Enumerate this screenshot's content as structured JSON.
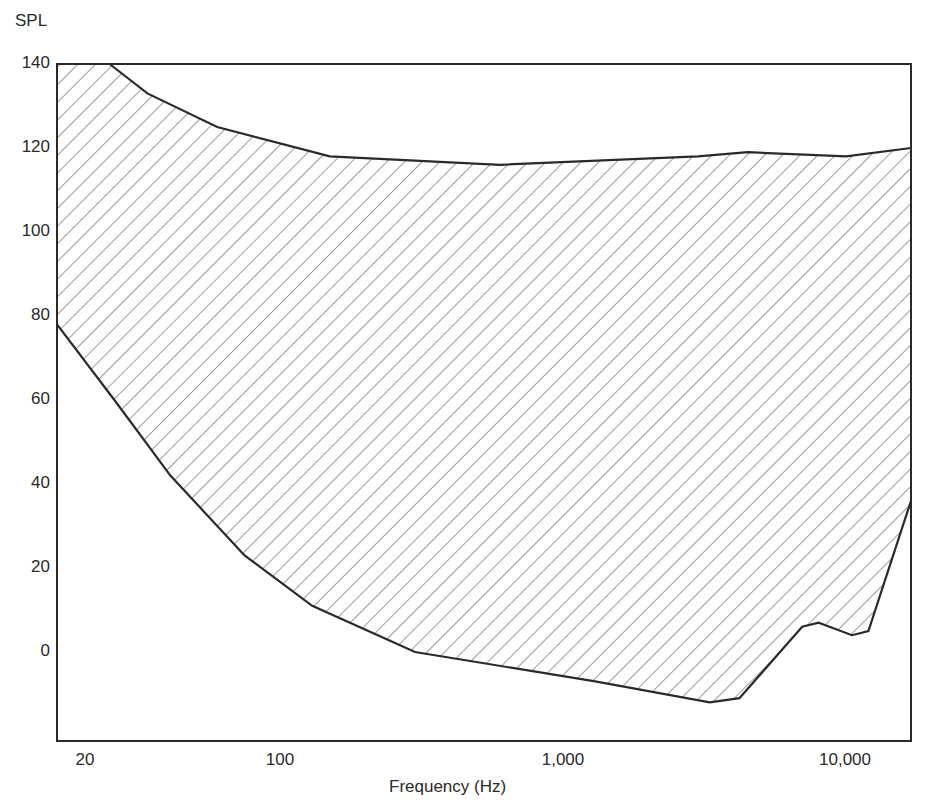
{
  "chart_data": {
    "type": "area",
    "title": "",
    "xlabel": "Frequency (Hz)",
    "ylabel": "SPL",
    "xscale": "log",
    "xlim": [
      16,
      20000
    ],
    "ylim": [
      -21,
      140
    ],
    "x_ticks": [
      20,
      100,
      1000,
      10000
    ],
    "x_tick_labels": [
      "20",
      "100",
      "1,000",
      "10,000"
    ],
    "y_ticks": [
      140,
      120,
      100,
      80,
      60,
      40,
      20,
      0
    ],
    "y_tick_labels": [
      "140",
      "120",
      "100",
      "80",
      "60",
      "40",
      "20",
      "0"
    ],
    "grid": false,
    "legend": null,
    "fill": "diagonal hatching",
    "series": [
      {
        "name": "Upper boundary (threshold of pain)",
        "x": [
          16,
          25,
          34,
          60,
          150,
          600,
          3000,
          4500,
          10000,
          17000
        ],
        "y": [
          140,
          140,
          133,
          125,
          118,
          116,
          118,
          119,
          118,
          120
        ]
      },
      {
        "name": "Lower boundary (threshold of hearing)",
        "x": [
          16,
          26,
          41,
          75,
          130,
          300,
          1300,
          3300,
          4200,
          7000,
          8000,
          10500,
          12000,
          17000
        ],
        "y": [
          78,
          60,
          42,
          23,
          11,
          0,
          -7,
          -12,
          -11,
          6,
          7,
          4,
          5,
          36
        ]
      }
    ]
  },
  "axes": {
    "y_title": "SPL",
    "x_title": "Frequency (Hz)",
    "y_ticks": [
      "140",
      "120",
      "100",
      "80",
      "60",
      "40",
      "20",
      "0"
    ],
    "x_ticks": [
      "20",
      "100",
      "1,000",
      "10,000"
    ]
  },
  "colors": {
    "stroke": "#2a2a2a",
    "hatch": "#3a3a3a",
    "background": "#ffffff"
  }
}
